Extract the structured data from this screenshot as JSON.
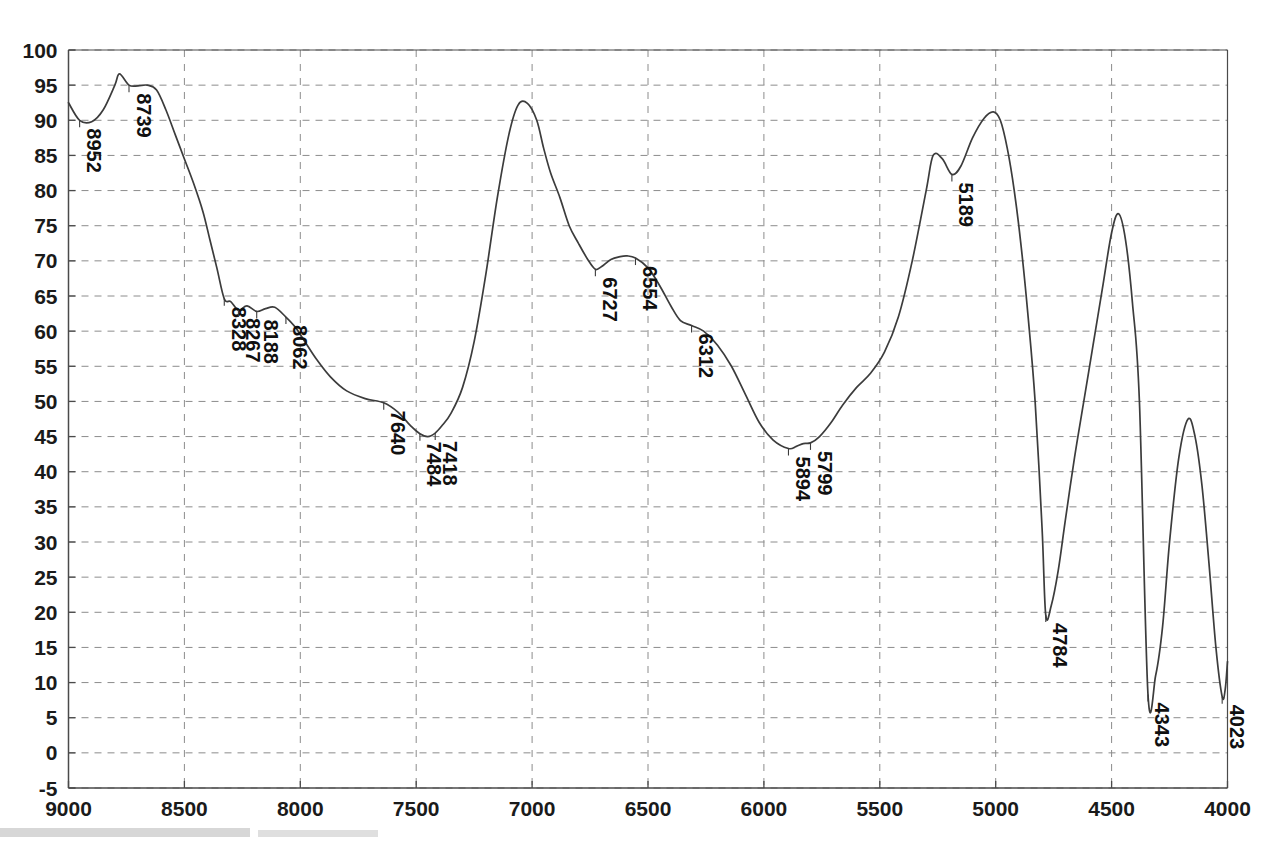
{
  "chart_data": {
    "type": "line",
    "title": "",
    "subtitle": "",
    "xlabel": "",
    "ylabel": "",
    "xlim": [
      9000,
      4000
    ],
    "ylim": [
      -5,
      100
    ],
    "x_reversed": true,
    "grid": true,
    "legend": null,
    "x_ticks": [
      9000,
      8500,
      8000,
      7500,
      7000,
      6500,
      6000,
      5500,
      5000,
      4500,
      4000
    ],
    "y_ticks": [
      -5,
      0,
      5,
      10,
      15,
      20,
      25,
      30,
      35,
      40,
      45,
      50,
      55,
      60,
      65,
      70,
      75,
      80,
      85,
      90,
      95,
      100
    ],
    "series": [
      {
        "name": "transmittance",
        "color": "#3c3c3c",
        "x": [
          9000,
          8952,
          8900,
          8850,
          8800,
          8780,
          8739,
          8700,
          8660,
          8620,
          8580,
          8540,
          8500,
          8460,
          8420,
          8390,
          8360,
          8328,
          8300,
          8267,
          8230,
          8188,
          8150,
          8110,
          8062,
          8020,
          7980,
          7930,
          7870,
          7800,
          7720,
          7640,
          7580,
          7520,
          7484,
          7450,
          7418,
          7390,
          7350,
          7300,
          7250,
          7200,
          7150,
          7100,
          7060,
          7020,
          6980,
          6950,
          6920,
          6880,
          6840,
          6800,
          6760,
          6727,
          6700,
          6660,
          6620,
          6590,
          6554,
          6500,
          6450,
          6400,
          6360,
          6312,
          6260,
          6200,
          6140,
          6080,
          6020,
          5960,
          5894,
          5860,
          5830,
          5799,
          5760,
          5710,
          5660,
          5600,
          5540,
          5480,
          5420,
          5360,
          5300,
          5270,
          5230,
          5189,
          5150,
          5100,
          5050,
          5010,
          4980,
          4950,
          4920,
          4890,
          4860,
          4830,
          4800,
          4784,
          4760,
          4730,
          4700,
          4660,
          4620,
          4580,
          4540,
          4500,
          4470,
          4440,
          4410,
          4380,
          4343,
          4310,
          4280,
          4250,
          4210,
          4170,
          4140,
          4110,
          4080,
          4050,
          4023,
          4010,
          4000
        ],
        "y": [
          92.5,
          90.0,
          89.8,
          91.5,
          95.0,
          96.6,
          95.0,
          94.9,
          95.0,
          94.3,
          91.5,
          88.0,
          84.5,
          81.0,
          77.0,
          73.0,
          69.0,
          64.6,
          64.2,
          63.0,
          63.6,
          62.8,
          63.2,
          63.4,
          62.0,
          60.5,
          58.5,
          56.0,
          53.5,
          51.5,
          50.4,
          49.8,
          48.5,
          46.4,
          45.4,
          45.0,
          45.5,
          46.5,
          48.3,
          52.0,
          58.5,
          68.0,
          79.0,
          88.0,
          92.2,
          92.4,
          90.0,
          86.0,
          82.5,
          79.0,
          75.0,
          72.5,
          70.2,
          68.8,
          69.2,
          70.2,
          70.6,
          70.7,
          70.4,
          69.0,
          66.5,
          63.5,
          61.5,
          60.8,
          60.0,
          58.0,
          55.0,
          51.0,
          47.0,
          44.5,
          43.3,
          43.6,
          44.0,
          44.1,
          45.0,
          47.0,
          49.5,
          52.0,
          54.0,
          57.0,
          62.0,
          70.0,
          80.0,
          85.0,
          84.5,
          82.3,
          83.5,
          87.5,
          90.3,
          91.2,
          90.0,
          86.0,
          80.0,
          72.0,
          62.0,
          50.0,
          32.0,
          19.6,
          21.0,
          26.0,
          33.0,
          42.0,
          50.0,
          58.0,
          66.0,
          74.0,
          76.7,
          73.0,
          64.0,
          50.0,
          8.3,
          11.0,
          18.0,
          30.0,
          42.0,
          47.5,
          45.0,
          38.0,
          27.0,
          15.0,
          8.0,
          9.0,
          13.0
        ]
      }
    ],
    "annotations": [
      {
        "label": "8952",
        "x": 8952,
        "y": 90.0,
        "side": "below"
      },
      {
        "label": "8739",
        "x": 8739,
        "y": 95.0,
        "side": "below"
      },
      {
        "label": "8328",
        "x": 8328,
        "y": 64.6,
        "side": "below"
      },
      {
        "label": "8267",
        "x": 8267,
        "y": 63.0,
        "side": "below"
      },
      {
        "label": "8188",
        "x": 8188,
        "y": 62.8,
        "side": "below"
      },
      {
        "label": "8062",
        "x": 8062,
        "y": 62.0,
        "side": "below"
      },
      {
        "label": "7640",
        "x": 7640,
        "y": 49.8,
        "side": "below"
      },
      {
        "label": "7484",
        "x": 7484,
        "y": 45.4,
        "side": "below"
      },
      {
        "label": "7418",
        "x": 7418,
        "y": 45.5,
        "side": "below"
      },
      {
        "label": "6727",
        "x": 6727,
        "y": 68.8,
        "side": "below"
      },
      {
        "label": "6554",
        "x": 6554,
        "y": 70.4,
        "side": "below"
      },
      {
        "label": "6312",
        "x": 6312,
        "y": 60.8,
        "side": "below"
      },
      {
        "label": "5894",
        "x": 5894,
        "y": 43.3,
        "side": "below"
      },
      {
        "label": "5799",
        "x": 5799,
        "y": 44.1,
        "side": "below"
      },
      {
        "label": "5189",
        "x": 5189,
        "y": 82.3,
        "side": "below"
      },
      {
        "label": "4784",
        "x": 4784,
        "y": 19.6,
        "side": "below"
      },
      {
        "label": "4343",
        "x": 4343,
        "y": 8.3,
        "side": "below"
      },
      {
        "label": "4023",
        "x": 4023,
        "y": 8.0,
        "side": "below"
      }
    ]
  }
}
